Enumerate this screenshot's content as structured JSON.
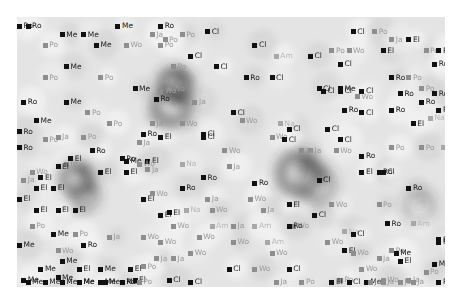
{
  "map": {
    "type": "density-map-with-labels",
    "x_range": [
      0,
      100
    ],
    "y_range": [
      0,
      100
    ],
    "background_shade": "#e4e4e4",
    "categories": {
      "Ro": {
        "style": "dark"
      },
      "El": {
        "style": "dark"
      },
      "Me": {
        "style": "dark"
      },
      "Cl": {
        "style": "dark"
      },
      "Po": {
        "style": "light"
      },
      "Ja": {
        "style": "light"
      },
      "Wo": {
        "style": "light"
      },
      "Am": {
        "style": "faint"
      },
      "Na": {
        "style": "faint"
      }
    },
    "hotspots": [
      {
        "x": 37,
        "y": 25,
        "intensity": 1.0,
        "spread": 6
      },
      {
        "x": 36,
        "y": 33,
        "intensity": 0.8,
        "spread": 7
      },
      {
        "x": 14,
        "y": 60,
        "intensity": 0.9,
        "spread": 6
      },
      {
        "x": 16,
        "y": 66,
        "intensity": 0.6,
        "spread": 5
      },
      {
        "x": 66,
        "y": 58,
        "intensity": 0.75,
        "spread": 8
      },
      {
        "x": 70,
        "y": 62,
        "intensity": 0.5,
        "spread": 7
      },
      {
        "x": 94,
        "y": 70,
        "intensity": 0.35,
        "spread": 6
      }
    ],
    "labels": [
      {
        "t": "Me",
        "x": 23,
        "y": 2
      },
      {
        "t": "Me",
        "x": 10,
        "y": 5
      },
      {
        "t": "Me",
        "x": 15,
        "y": 5
      },
      {
        "t": "Ja",
        "x": 31,
        "y": 5
      },
      {
        "t": "Po",
        "x": 38,
        "y": 5
      },
      {
        "t": "Ro",
        "x": 2,
        "y": 2
      },
      {
        "t": "Po",
        "x": 6,
        "y": 9
      },
      {
        "t": "Me",
        "x": 18,
        "y": 9
      },
      {
        "t": "Wo",
        "x": 25,
        "y": 9
      },
      {
        "t": "Po",
        "x": 33,
        "y": 9
      },
      {
        "t": "Me",
        "x": 11,
        "y": 17
      },
      {
        "t": "Po",
        "x": 6,
        "y": 21
      },
      {
        "t": "Po",
        "x": 19,
        "y": 21
      },
      {
        "t": "Me",
        "x": 27,
        "y": 25
      },
      {
        "t": "Wo",
        "x": 35,
        "y": 25
      },
      {
        "t": "Ro",
        "x": 1,
        "y": 30
      },
      {
        "t": "Me",
        "x": 11,
        "y": 30
      },
      {
        "t": "Po",
        "x": 16,
        "y": 34
      },
      {
        "t": "Po",
        "x": 21,
        "y": 38
      },
      {
        "t": "Ja",
        "x": 31,
        "y": 38
      },
      {
        "t": "Po",
        "x": 6,
        "y": 44
      },
      {
        "t": "Ro",
        "x": 17,
        "y": 48
      },
      {
        "t": "Me",
        "x": 25,
        "y": 52
      },
      {
        "t": "Ja",
        "x": 30,
        "y": 55
      },
      {
        "t": "Ja",
        "x": 11,
        "y": 53
      },
      {
        "t": "El",
        "x": 19,
        "y": 56
      },
      {
        "t": "Wo",
        "x": 3,
        "y": 56
      },
      {
        "t": "Ro",
        "x": 0,
        "y": 2
      },
      {
        "t": "Cl",
        "x": 44,
        "y": 4
      },
      {
        "t": "Ro",
        "x": 33,
        "y": 2
      },
      {
        "t": "Po",
        "x": 34,
        "y": 7
      },
      {
        "t": "Cl",
        "x": 55,
        "y": 9
      },
      {
        "t": "Cl",
        "x": 40,
        "y": 13
      },
      {
        "t": "Am",
        "x": 60,
        "y": 13
      },
      {
        "t": "Cl",
        "x": 68,
        "y": 13
      },
      {
        "t": "Po",
        "x": 36,
        "y": 17
      },
      {
        "t": "Cl",
        "x": 46,
        "y": 17
      },
      {
        "t": "Ro",
        "x": 53,
        "y": 21
      },
      {
        "t": "Cl",
        "x": 59,
        "y": 21
      },
      {
        "t": "Cl",
        "x": 71,
        "y": 26
      },
      {
        "t": "Cl",
        "x": 75,
        "y": 26
      },
      {
        "t": "Cl",
        "x": 80,
        "y": 26
      },
      {
        "t": "Wo",
        "x": 33,
        "y": 26
      },
      {
        "t": "Ja",
        "x": 41,
        "y": 30
      },
      {
        "t": "Cl",
        "x": 50,
        "y": 34
      },
      {
        "t": "Cl",
        "x": 80,
        "y": 34
      },
      {
        "t": "Cl",
        "x": 63,
        "y": 40
      },
      {
        "t": "Cl",
        "x": 72,
        "y": 40
      },
      {
        "t": "Ro",
        "x": 32,
        "y": 29
      },
      {
        "t": "Cl",
        "x": 43,
        "y": 43
      },
      {
        "t": "Wo",
        "x": 59,
        "y": 43
      },
      {
        "t": "Cl",
        "x": 75,
        "y": 44
      },
      {
        "t": "Wo",
        "x": 48,
        "y": 48
      },
      {
        "t": "Ja",
        "x": 68,
        "y": 48
      },
      {
        "t": "Cl",
        "x": 78,
        "y": 4
      },
      {
        "t": "Po",
        "x": 83,
        "y": 4
      },
      {
        "t": "Po",
        "x": 73,
        "y": 11
      },
      {
        "t": "Wo",
        "x": 77,
        "y": 11
      },
      {
        "t": "El",
        "x": 85,
        "y": 11
      },
      {
        "t": "Ja",
        "x": 87,
        "y": 7
      },
      {
        "t": "El",
        "x": 91,
        "y": 7
      },
      {
        "t": "Po",
        "x": 95,
        "y": 11
      },
      {
        "t": "Cl",
        "x": 75,
        "y": 16
      },
      {
        "t": "Ro",
        "x": 98,
        "y": 11
      },
      {
        "t": "Ro",
        "x": 87,
        "y": 21
      },
      {
        "t": "Po",
        "x": 91,
        "y": 21
      },
      {
        "t": "Ro",
        "x": 97,
        "y": 16
      },
      {
        "t": "Cl",
        "x": 70,
        "y": 25
      },
      {
        "t": "Me",
        "x": 75,
        "y": 25
      },
      {
        "t": "Wo",
        "x": 79,
        "y": 28
      },
      {
        "t": "Po",
        "x": 94,
        "y": 25
      },
      {
        "t": "Ro",
        "x": 89,
        "y": 27
      },
      {
        "t": "Ro",
        "x": 94,
        "y": 30
      },
      {
        "t": "Ro",
        "x": 97,
        "y": 27
      },
      {
        "t": "Ro",
        "x": 76,
        "y": 33
      },
      {
        "t": "Ro",
        "x": 87,
        "y": 33
      },
      {
        "t": "Ro",
        "x": 98,
        "y": 33
      },
      {
        "t": "Na",
        "x": 96,
        "y": 36
      },
      {
        "t": "El",
        "x": 92,
        "y": 38
      },
      {
        "t": "Ro",
        "x": 0,
        "y": 41
      },
      {
        "t": "Me",
        "x": 4,
        "y": 37
      },
      {
        "t": "Ja",
        "x": 9,
        "y": 43
      },
      {
        "t": "Po",
        "x": 15,
        "y": 43
      },
      {
        "t": "Ja",
        "x": 28,
        "y": 45
      },
      {
        "t": "El",
        "x": 33,
        "y": 43
      },
      {
        "t": "Ro",
        "x": 0,
        "y": 47
      },
      {
        "t": "El",
        "x": 12,
        "y": 51
      },
      {
        "t": "El",
        "x": 9,
        "y": 54
      },
      {
        "t": "Ja",
        "x": 1,
        "y": 59
      },
      {
        "t": "El",
        "x": 5,
        "y": 58
      },
      {
        "t": "El",
        "x": 25,
        "y": 56
      },
      {
        "t": "El",
        "x": 30,
        "y": 52
      },
      {
        "t": "El",
        "x": 4,
        "y": 62
      },
      {
        "t": "El",
        "x": 8,
        "y": 62
      },
      {
        "t": "El",
        "x": 0,
        "y": 66
      },
      {
        "t": "El",
        "x": 4,
        "y": 70
      },
      {
        "t": "El",
        "x": 9,
        "y": 70
      },
      {
        "t": "El",
        "x": 13,
        "y": 70
      },
      {
        "t": "El",
        "x": 29,
        "y": 66
      },
      {
        "t": "Po",
        "x": 3,
        "y": 76
      },
      {
        "t": "Wo",
        "x": 38,
        "y": 38
      },
      {
        "t": "Ro",
        "x": 29,
        "y": 42
      },
      {
        "t": "Cl",
        "x": 43,
        "y": 42
      },
      {
        "t": "Wo",
        "x": 52,
        "y": 37
      },
      {
        "t": "Na",
        "x": 61,
        "y": 38
      },
      {
        "t": "Cl",
        "x": 62,
        "y": 44
      },
      {
        "t": "Ja",
        "x": 66,
        "y": 48
      },
      {
        "t": "Wo",
        "x": 74,
        "y": 48
      },
      {
        "t": "Ro",
        "x": 24,
        "y": 51
      },
      {
        "t": "Wo",
        "x": 28,
        "y": 53
      },
      {
        "t": "Na",
        "x": 38,
        "y": 53
      },
      {
        "t": "Ja",
        "x": 49,
        "y": 54
      },
      {
        "t": "Ro",
        "x": 43,
        "y": 58
      },
      {
        "t": "Ro",
        "x": 55,
        "y": 60
      },
      {
        "t": "Wo",
        "x": 54,
        "y": 66
      },
      {
        "t": "Ro",
        "x": 38,
        "y": 62
      },
      {
        "t": "Wo",
        "x": 31,
        "y": 64
      },
      {
        "t": "Ja",
        "x": 44,
        "y": 66
      },
      {
        "t": "Ja",
        "x": 57,
        "y": 70
      },
      {
        "t": "El",
        "x": 33,
        "y": 72
      },
      {
        "t": "Wo",
        "x": 36,
        "y": 76
      },
      {
        "t": "Ja",
        "x": 50,
        "y": 76
      },
      {
        "t": "Am",
        "x": 45,
        "y": 76
      },
      {
        "t": "Wo",
        "x": 33,
        "y": 82
      },
      {
        "t": "Wo",
        "x": 64,
        "y": 76
      },
      {
        "t": "Ro",
        "x": 80,
        "y": 50
      },
      {
        "t": "Po",
        "x": 87,
        "y": 47
      },
      {
        "t": "Po",
        "x": 94,
        "y": 47
      },
      {
        "t": "Am",
        "x": 99,
        "y": 47
      },
      {
        "t": "El",
        "x": 80,
        "y": 56
      },
      {
        "t": "Ro",
        "x": 84,
        "y": 56
      },
      {
        "t": "Cl",
        "x": 70,
        "y": 59
      },
      {
        "t": "Cl",
        "x": 85,
        "y": 56
      },
      {
        "t": "Ro",
        "x": 91,
        "y": 62
      },
      {
        "t": "Wo",
        "x": 73,
        "y": 68
      },
      {
        "t": "El",
        "x": 63,
        "y": 68
      },
      {
        "t": "Po",
        "x": 84,
        "y": 68
      },
      {
        "t": "Ro",
        "x": 86,
        "y": 75
      },
      {
        "t": "Am",
        "x": 92,
        "y": 75
      },
      {
        "t": "Na",
        "x": 76,
        "y": 78
      },
      {
        "t": "El",
        "x": 76,
        "y": 85
      },
      {
        "t": "Po",
        "x": 87,
        "y": 85
      },
      {
        "t": "Ro",
        "x": 98,
        "y": 81
      },
      {
        "t": "El",
        "x": 89,
        "y": 89
      },
      {
        "t": "Ro",
        "x": 98,
        "y": 82
      },
      {
        "t": "Po",
        "x": 95,
        "y": 93
      },
      {
        "t": "Me",
        "x": 8,
        "y": 79
      },
      {
        "t": "Po",
        "x": 13,
        "y": 79
      },
      {
        "t": "Ja",
        "x": 21,
        "y": 80
      },
      {
        "t": "Wo",
        "x": 29,
        "y": 80
      },
      {
        "t": "El",
        "x": 35,
        "y": 71
      },
      {
        "t": "Me",
        "x": 0,
        "y": 83
      },
      {
        "t": "Wo",
        "x": 9,
        "y": 85
      },
      {
        "t": "Ro",
        "x": 15,
        "y": 83
      },
      {
        "t": "Me",
        "x": 10,
        "y": 89
      },
      {
        "t": "Me",
        "x": 5,
        "y": 92
      },
      {
        "t": "El",
        "x": 14,
        "y": 92
      },
      {
        "t": "Me",
        "x": 19,
        "y": 92
      },
      {
        "t": "El",
        "x": 26,
        "y": 92
      },
      {
        "t": "Me",
        "x": 1,
        "y": 96
      },
      {
        "t": "Me",
        "x": 9,
        "y": 95
      },
      {
        "t": "Me",
        "x": 14,
        "y": 97
      },
      {
        "t": "Me",
        "x": 19,
        "y": 97
      },
      {
        "t": "Me",
        "x": 24,
        "y": 99
      },
      {
        "t": "El",
        "x": 27,
        "y": 96
      },
      {
        "t": "Me",
        "x": 2,
        "y": 103
      },
      {
        "t": "Me",
        "x": 6,
        "y": 103
      },
      {
        "t": "Me",
        "x": 10,
        "y": 105
      },
      {
        "t": "Me",
        "x": 14,
        "y": 103
      },
      {
        "t": "Me",
        "x": 20,
        "y": 105
      },
      {
        "t": "Ro",
        "x": 24,
        "y": 105
      },
      {
        "t": "Po",
        "x": 28,
        "y": 103
      },
      {
        "t": "Ja",
        "x": 32,
        "y": 88
      },
      {
        "t": "Ja",
        "x": 36,
        "y": 88
      },
      {
        "t": "Po",
        "x": 29,
        "y": 91
      },
      {
        "t": "Cl",
        "x": 35,
        "y": 96
      },
      {
        "t": "Cl",
        "x": 40,
        "y": 100
      },
      {
        "t": "Cl",
        "x": 49,
        "y": 92
      },
      {
        "t": "Wo",
        "x": 55,
        "y": 92
      },
      {
        "t": "Ja",
        "x": 60,
        "y": 99
      },
      {
        "t": "Cl",
        "x": 63,
        "y": 92
      },
      {
        "t": "Wo",
        "x": 45,
        "y": 70
      },
      {
        "t": "Na",
        "x": 39,
        "y": 70
      },
      {
        "t": "Am",
        "x": 55,
        "y": 76
      },
      {
        "t": "Wo",
        "x": 50,
        "y": 82
      },
      {
        "t": "Wo",
        "x": 40,
        "y": 86
      },
      {
        "t": "Wo",
        "x": 42,
        "y": 80
      },
      {
        "t": "Ro",
        "x": 63,
        "y": 76
      },
      {
        "t": "Wo",
        "x": 59,
        "y": 86
      },
      {
        "t": "Am",
        "x": 58,
        "y": 82
      },
      {
        "t": "Cl",
        "x": 69,
        "y": 72
      },
      {
        "t": "Wo",
        "x": 72,
        "y": 82
      },
      {
        "t": "Cl",
        "x": 78,
        "y": 79
      },
      {
        "t": "Wo",
        "x": 78,
        "y": 86
      },
      {
        "t": "Ja",
        "x": 84,
        "y": 88
      },
      {
        "t": "Me",
        "x": 88,
        "y": 86
      },
      {
        "t": "Me",
        "x": 97,
        "y": 90
      },
      {
        "t": "Wo",
        "x": 80,
        "y": 92
      },
      {
        "t": "Ja",
        "x": 82,
        "y": 99
      },
      {
        "t": "Wo",
        "x": 85,
        "y": 96
      },
      {
        "t": "Ja",
        "x": 91,
        "y": 96
      },
      {
        "t": "Po",
        "x": 75,
        "y": 96
      },
      {
        "t": "El",
        "x": 73,
        "y": 100
      },
      {
        "t": "Cl",
        "x": 77,
        "y": 103
      },
      {
        "t": "Me",
        "x": 81,
        "y": 103
      },
      {
        "t": "Ja",
        "x": 85,
        "y": 103
      },
      {
        "t": "Ja",
        "x": 92,
        "y": 101
      },
      {
        "t": "Ro",
        "x": 98,
        "y": 103
      },
      {
        "t": "Po",
        "x": 66,
        "y": 107
      },
      {
        "t": "Ja",
        "x": 82,
        "y": 107
      },
      {
        "t": "Ja",
        "x": 89,
        "y": 107
      }
    ]
  }
}
